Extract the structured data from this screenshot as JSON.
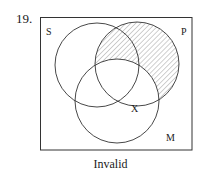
{
  "problem_number": "19.",
  "caption": "Invalid",
  "venn": {
    "box": {
      "x": 40,
      "y": 17,
      "width": 152,
      "height": 133
    },
    "circles": [
      {
        "label": "S",
        "cx": 97,
        "cy": 65,
        "r": 42,
        "label_x": 46,
        "label_y": 35
      },
      {
        "label": "P",
        "cx": 137,
        "cy": 64,
        "r": 42,
        "label_x": 181,
        "label_y": 35
      },
      {
        "label": "M",
        "cx": 117,
        "cy": 101,
        "r": 42,
        "label_x": 166,
        "label_y": 141
      }
    ],
    "shaded_region": "P outside M",
    "shading_style": "diagonal hatch",
    "marker": {
      "label": "X",
      "x": 131,
      "y": 112
    },
    "colors": {
      "stroke": "#333333",
      "hatch": "#8a8a8a",
      "background": "#ffffff"
    }
  }
}
